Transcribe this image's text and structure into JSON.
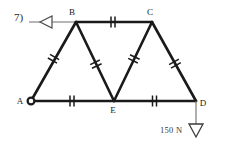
{
  "figure": {
    "problem_number": "7)",
    "type": "truss-free-body-diagram",
    "background_color": "#ffffff",
    "line_color": "#1a1a1a"
  },
  "nodes": [
    {
      "id": "A",
      "label": "A",
      "x": 31,
      "y": 101,
      "label_x": 20,
      "label_y": 104,
      "marker": "pin-circle"
    },
    {
      "id": "B",
      "label": "B",
      "x": 76,
      "y": 22,
      "label_x": 72,
      "label_y": 14,
      "marker": "none"
    },
    {
      "id": "C",
      "label": "C",
      "x": 152,
      "y": 22,
      "label_x": 148,
      "label_y": 14,
      "marker": "none"
    },
    {
      "id": "D",
      "label": "D",
      "x": 196,
      "y": 101,
      "label_x": 201,
      "label_y": 105,
      "marker": "none"
    },
    {
      "id": "E",
      "label": "E",
      "x": 114,
      "y": 101,
      "label_x": 110,
      "label_y": 112,
      "marker": "none"
    }
  ],
  "members": [
    {
      "id": "AB",
      "from": "A",
      "to": "B",
      "ticks": 2
    },
    {
      "id": "BC",
      "from": "B",
      "to": "C",
      "ticks": 2
    },
    {
      "id": "BE",
      "from": "B",
      "to": "E",
      "ticks": 2
    },
    {
      "id": "EC",
      "from": "E",
      "to": "C",
      "ticks": 2
    },
    {
      "id": "CD",
      "from": "C",
      "to": "D",
      "ticks": 2
    },
    {
      "id": "AE",
      "from": "A",
      "to": "E",
      "ticks": 2
    },
    {
      "id": "ED",
      "from": "E",
      "to": "D",
      "ticks": 2
    }
  ],
  "support": {
    "name": "roller-support-at-B",
    "symbol": "left-pointing-triangle",
    "leader_line_from_x": 29,
    "leader_line_to_x": 76,
    "leader_line_y": 22,
    "triangle_tip_x": 40,
    "triangle_back_x": 52,
    "triangle_half_height": 6
  },
  "load": {
    "name": "applied-load-at-D",
    "magnitude": "150 N",
    "direction": "downward",
    "label_x": 160,
    "label_y": 130,
    "arrow_x": 196,
    "arrow_top_y": 101,
    "arrow_tip_y": 137
  }
}
